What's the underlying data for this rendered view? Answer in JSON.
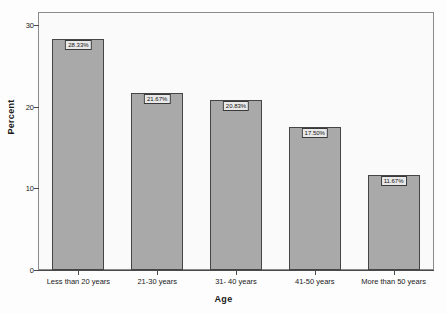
{
  "chart_data": {
    "type": "bar",
    "title": "",
    "subtitle": "",
    "xlabel": "Age",
    "ylabel": "Percent",
    "categories": [
      "Less than 20 years",
      "21-30 years",
      "31- 40 years",
      "41-50 years",
      "More than 50 years"
    ],
    "values": [
      28.33,
      21.67,
      20.83,
      17.5,
      11.67
    ],
    "data_labels": [
      "28.33%",
      "21.67%",
      "20.83%",
      "17.50%",
      "11.67%"
    ],
    "ylim": [
      0,
      31.5
    ],
    "yticks": [
      0,
      10,
      20,
      30
    ],
    "ytick_labels": [
      "0",
      "10",
      "20",
      "30"
    ],
    "grid": false,
    "legend": null,
    "bar_color": "#a9a9a9",
    "bar_border_color": "#454545",
    "label_box_color": "#e9e9e9",
    "axis_color": "#4a4a4a",
    "frame_color": "#8b8b8b",
    "plot_background": "#fafafa",
    "figure_background": "#fdfdfd"
  }
}
